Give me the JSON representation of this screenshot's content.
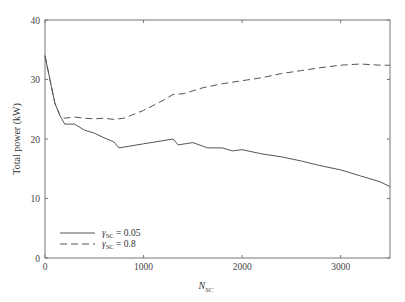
{
  "chart_data": {
    "type": "line",
    "title": "",
    "xlabel": "N_SC",
    "ylabel": "Total power (kW)",
    "xlim": [
      0,
      3500
    ],
    "ylim": [
      0,
      40
    ],
    "x_ticks": [
      0,
      1000,
      2000,
      3000
    ],
    "y_ticks": [
      0,
      10,
      20,
      30,
      40
    ],
    "grid": false,
    "legend_position": "lower left",
    "series": [
      {
        "name": "γ_SC = 0.05",
        "style": "solid",
        "x": [
          0,
          50,
          100,
          150,
          200,
          300,
          400,
          500,
          600,
          700,
          750,
          1000,
          1300,
          1350,
          1500,
          1650,
          1800,
          1900,
          2000,
          2200,
          2400,
          2600,
          2800,
          3000,
          3200,
          3400,
          3500
        ],
        "y": [
          34,
          30,
          26,
          24,
          22.5,
          22.5,
          21.5,
          21,
          20.2,
          19.5,
          18.5,
          19.2,
          20,
          19,
          19.4,
          18.5,
          18.5,
          18,
          18.2,
          17.5,
          17,
          16.3,
          15.5,
          14.8,
          13.8,
          12.8,
          12
        ]
      },
      {
        "name": "γ_SC = 0.8",
        "style": "dashed",
        "x": [
          0,
          50,
          100,
          150,
          200,
          300,
          400,
          500,
          600,
          700,
          800,
          1000,
          1200,
          1300,
          1400,
          1600,
          1800,
          2000,
          2200,
          2400,
          2600,
          2800,
          3000,
          3200,
          3400,
          3500
        ],
        "y": [
          34,
          30,
          26,
          24,
          23.5,
          23.7,
          23.5,
          23.4,
          23.5,
          23.3,
          23.5,
          24.8,
          26.5,
          27.5,
          27.6,
          28.6,
          29.3,
          29.8,
          30.3,
          31,
          31.5,
          32,
          32.4,
          32.6,
          32.4,
          32.4
        ]
      }
    ]
  },
  "axes": {
    "ylabel": "Total power (kW)",
    "xlabel_main": "N",
    "xlabel_sub": "SC",
    "y_tick_labels": [
      "0",
      "10",
      "20",
      "30",
      "40"
    ],
    "x_tick_labels": [
      "0",
      "1000",
      "2000",
      "3000"
    ]
  },
  "legend": {
    "items": [
      {
        "symbol": "γ",
        "sub": "SC",
        "value": " = 0.05",
        "style": "solid"
      },
      {
        "symbol": "γ",
        "sub": "SC",
        "value": " = 0.8",
        "style": "dashed"
      }
    ]
  }
}
